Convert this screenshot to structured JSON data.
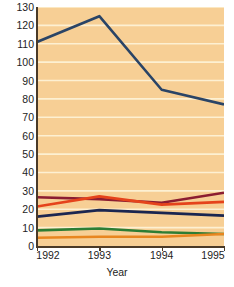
{
  "chart_data": {
    "type": "line",
    "title": "",
    "xlabel": "Year",
    "ylabel": "Incidence per 100,000 Population",
    "x": [
      1992,
      1993,
      1994,
      1995
    ],
    "xticklabels": [
      "1992",
      "1993",
      "1994",
      "1995"
    ],
    "xlim": [
      1992,
      1995
    ],
    "ylim": [
      0,
      130
    ],
    "yticks": [
      0,
      10,
      20,
      30,
      40,
      50,
      60,
      70,
      80,
      90,
      100,
      110,
      120,
      130
    ],
    "yticklabels": [
      "0",
      "10",
      "20",
      "30",
      "40",
      "50",
      "60",
      "70",
      "80",
      "90",
      "100",
      "110",
      "120",
      "130"
    ],
    "grid": "horizontal",
    "legend": "none",
    "plot_background": "#f7cf95",
    "gridline_color": "#fdf0d2",
    "axis_color": "#4a3a28",
    "series": [
      {
        "name": "series-1",
        "color": "#2a4466",
        "values": [
          111,
          125,
          85,
          77
        ]
      },
      {
        "name": "series-2",
        "color": "#8b1d31",
        "values": [
          26.5,
          25.5,
          23.5,
          29
        ]
      },
      {
        "name": "series-3",
        "color": "#e5431b",
        "values": [
          21.5,
          27,
          22.5,
          24
        ]
      },
      {
        "name": "series-4",
        "color": "#1b2650",
        "values": [
          16,
          19.5,
          18,
          16.5
        ]
      },
      {
        "name": "series-5",
        "color": "#2d7d34",
        "values": [
          8.5,
          9.5,
          7.5,
          6.5
        ]
      },
      {
        "name": "series-6",
        "color": "#e8861f",
        "values": [
          4.5,
          5,
          5,
          6.5
        ]
      }
    ]
  }
}
